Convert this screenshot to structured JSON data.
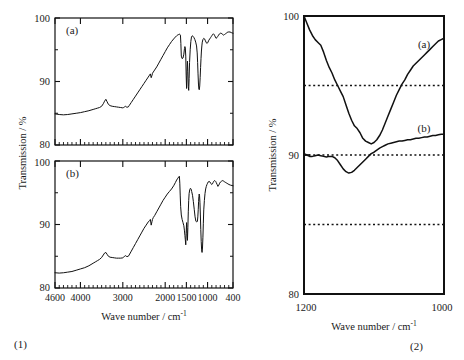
{
  "figure": {
    "panels": [
      {
        "number": "(1)",
        "xlabel": "Wave number / cm",
        "xlabel_sup": "-1",
        "ylabel": "Transmission / %",
        "subplots": [
          {
            "label": "(a)"
          },
          {
            "label": "(b)"
          }
        ]
      },
      {
        "number": "(2)",
        "xlabel": "Wave number / cm",
        "xlabel_sup": "-1",
        "ylabel": "Transmission / %",
        "curve_labels": [
          "(a)",
          "(b)"
        ]
      }
    ]
  },
  "chart_data": [
    {
      "type": "line",
      "id": "panel1-a",
      "title": "",
      "subplot_label": "(a)",
      "xlabel": "Wave number / cm-1",
      "ylabel": "Transmission / %",
      "xlim": [
        4600,
        400
      ],
      "ylim": [
        80,
        100
      ],
      "x_ticks": [
        4600,
        4000,
        3000,
        2000,
        1500,
        1000,
        400
      ],
      "x_tick_labels": [
        "4600",
        "4000",
        "3000",
        "2000",
        "1500",
        "1000",
        "400"
      ],
      "x_minor_ticks": [
        4500,
        4400,
        4300,
        4200,
        4100,
        3900,
        3800,
        3700,
        3600,
        3500,
        3400,
        3300,
        3200,
        3100,
        2900,
        2800,
        2700,
        2600,
        2500,
        2400,
        2300,
        2200,
        2100,
        1900,
        1800,
        1700,
        1600,
        1400,
        1300,
        1200,
        1100,
        900,
        800,
        700,
        600,
        500
      ],
      "y_ticks": [
        80,
        90,
        100
      ],
      "y_tick_labels": [
        "80",
        "90",
        "100"
      ],
      "grid": false,
      "axis_reversed_x": true,
      "x": [
        4600,
        4500,
        4400,
        4300,
        4200,
        4100,
        4000,
        3900,
        3800,
        3750,
        3700,
        3650,
        3600,
        3550,
        3500,
        3460,
        3430,
        3400,
        3370,
        3340,
        3300,
        3250,
        3200,
        3150,
        3100,
        3050,
        3000,
        2980,
        2960,
        2940,
        2920,
        2900,
        2870,
        2850,
        2800,
        2750,
        2700,
        2650,
        2600,
        2550,
        2500,
        2450,
        2400,
        2370,
        2350,
        2330,
        2310,
        2300,
        2280,
        2250,
        2200,
        2150,
        2100,
        2050,
        2000,
        1950,
        1900,
        1850,
        1800,
        1760,
        1730,
        1700,
        1680,
        1660,
        1650,
        1640,
        1630,
        1620,
        1600,
        1580,
        1560,
        1545,
        1535,
        1525,
        1515,
        1505,
        1495,
        1485,
        1475,
        1465,
        1455,
        1445,
        1435,
        1425,
        1410,
        1395,
        1380,
        1360,
        1340,
        1320,
        1300,
        1280,
        1260,
        1245,
        1235,
        1225,
        1215,
        1205,
        1195,
        1185,
        1175,
        1165,
        1155,
        1145,
        1135,
        1125,
        1110,
        1090,
        1070,
        1050,
        1030,
        1010,
        990,
        970,
        950,
        930,
        910,
        890,
        875,
        860,
        845,
        830,
        815,
        800,
        780,
        760,
        740,
        720,
        700,
        680,
        660,
        640,
        620,
        600,
        580,
        560,
        540,
        520,
        500,
        470,
        440,
        400
      ],
      "y": [
        84.9,
        84.8,
        84.75,
        84.8,
        84.9,
        85.0,
        85.1,
        85.25,
        85.4,
        85.5,
        85.6,
        85.7,
        85.8,
        85.9,
        86.1,
        86.5,
        86.9,
        87.2,
        86.8,
        86.4,
        86.2,
        86.1,
        86.05,
        86.0,
        85.95,
        85.9,
        85.85,
        85.9,
        86.0,
        86.1,
        86.0,
        85.95,
        86.0,
        86.2,
        86.7,
        87.2,
        87.7,
        88.2,
        88.7,
        89.2,
        89.7,
        90.2,
        90.7,
        91.0,
        91.2,
        90.6,
        91.0,
        91.3,
        91.5,
        91.8,
        92.3,
        92.9,
        93.5,
        94.1,
        94.7,
        95.3,
        95.8,
        96.3,
        96.7,
        97.0,
        97.2,
        97.35,
        97.4,
        97.45,
        97.4,
        97.3,
        96.0,
        94.0,
        93.6,
        93.7,
        94.3,
        95.2,
        95.5,
        95.3,
        94.0,
        91.0,
        88.9,
        91.5,
        93.2,
        91.6,
        89.2,
        88.6,
        90.5,
        93.0,
        95.0,
        96.3,
        97.0,
        97.2,
        97.1,
        96.9,
        96.6,
        96.2,
        95.6,
        94.5,
        93.0,
        91.2,
        89.6,
        88.8,
        88.7,
        89.3,
        90.6,
        92.2,
        93.6,
        94.8,
        95.6,
        96.2,
        96.6,
        96.8,
        96.7,
        96.4,
        96.1,
        96.0,
        96.2,
        96.5,
        96.7,
        96.9,
        97.1,
        97.3,
        97.45,
        97.5,
        97.4,
        97.2,
        97.0,
        96.8,
        96.9,
        97.1,
        97.3,
        97.5,
        97.6,
        97.6,
        97.5,
        97.4,
        97.3,
        97.4,
        97.5,
        97.6,
        97.7,
        97.8,
        97.8,
        97.8,
        97.7,
        97.6,
        97.5
      ]
    },
    {
      "type": "line",
      "id": "panel1-b",
      "title": "",
      "subplot_label": "(b)",
      "xlabel": "Wave number / cm-1",
      "ylabel": "Transmission / %",
      "xlim": [
        4600,
        400
      ],
      "ylim": [
        80,
        100
      ],
      "x_ticks": [
        4600,
        4000,
        3000,
        2000,
        1500,
        1000,
        400
      ],
      "x_tick_labels": [
        "4600",
        "4000",
        "3000",
        "2000",
        "1500",
        "1000",
        "400"
      ],
      "y_ticks": [
        80,
        90,
        100
      ],
      "y_tick_labels": [
        "80",
        "90",
        "100"
      ],
      "grid": false,
      "axis_reversed_x": true,
      "x": [
        4600,
        4500,
        4400,
        4300,
        4200,
        4100,
        4000,
        3900,
        3800,
        3750,
        3700,
        3650,
        3600,
        3550,
        3500,
        3460,
        3430,
        3400,
        3370,
        3340,
        3300,
        3250,
        3200,
        3150,
        3100,
        3050,
        3000,
        2980,
        2960,
        2940,
        2920,
        2900,
        2870,
        2850,
        2800,
        2750,
        2700,
        2650,
        2600,
        2550,
        2500,
        2450,
        2400,
        2370,
        2350,
        2330,
        2310,
        2300,
        2280,
        2250,
        2200,
        2150,
        2100,
        2050,
        2000,
        1950,
        1900,
        1850,
        1800,
        1760,
        1730,
        1700,
        1680,
        1665,
        1655,
        1645,
        1635,
        1620,
        1600,
        1580,
        1560,
        1545,
        1535,
        1525,
        1515,
        1505,
        1495,
        1485,
        1475,
        1465,
        1455,
        1445,
        1435,
        1420,
        1405,
        1390,
        1375,
        1355,
        1335,
        1315,
        1295,
        1275,
        1255,
        1240,
        1230,
        1220,
        1212,
        1205,
        1198,
        1190,
        1180,
        1170,
        1160,
        1150,
        1140,
        1130,
        1120,
        1110,
        1100,
        1090,
        1075,
        1060,
        1045,
        1030,
        1015,
        1000,
        985,
        965,
        945,
        925,
        905,
        885,
        870,
        855,
        840,
        825,
        810,
        795,
        775,
        755,
        735,
        715,
        695,
        675,
        655,
        635,
        615,
        595,
        570,
        545,
        520,
        495,
        460,
        400
      ],
      "y": [
        82.4,
        82.35,
        82.4,
        82.5,
        82.6,
        82.8,
        83.0,
        83.2,
        83.5,
        83.7,
        83.9,
        84.1,
        84.3,
        84.5,
        84.8,
        85.2,
        85.5,
        85.6,
        85.3,
        85.0,
        84.85,
        84.8,
        84.75,
        84.7,
        84.7,
        84.7,
        84.75,
        84.85,
        85.0,
        85.1,
        85.0,
        84.95,
        85.0,
        85.2,
        85.8,
        86.4,
        87.0,
        87.6,
        88.2,
        88.8,
        89.4,
        89.9,
        90.4,
        90.6,
        90.8,
        89.9,
        90.5,
        90.8,
        91.1,
        91.4,
        92.0,
        92.6,
        93.2,
        93.8,
        94.3,
        94.8,
        95.2,
        95.6,
        96.1,
        96.6,
        97.0,
        97.3,
        97.5,
        97.6,
        96.5,
        94.5,
        92.8,
        91.5,
        90.8,
        90.3,
        89.8,
        89.0,
        88.3,
        87.6,
        86.8,
        88.6,
        90.3,
        89.0,
        87.5,
        89.5,
        92.0,
        93.8,
        94.9,
        95.5,
        95.7,
        95.6,
        95.2,
        94.6,
        93.6,
        92.4,
        91.2,
        90.5,
        90.4,
        90.5,
        91.2,
        92.4,
        93.6,
        94.4,
        94.8,
        94.6,
        93.5,
        91.5,
        89.2,
        87.3,
        86.0,
        85.6,
        86.3,
        88.0,
        90.2,
        92.3,
        93.8,
        94.9,
        95.6,
        96.0,
        96.3,
        96.5,
        96.7,
        96.8,
        96.7,
        96.5,
        96.3,
        96.4,
        96.6,
        96.8,
        96.9,
        96.9,
        96.8,
        96.6,
        96.3,
        96.0,
        96.2,
        96.5,
        96.7,
        96.8,
        96.9,
        96.9,
        96.8,
        96.7,
        96.6,
        96.5,
        96.4,
        96.3,
        96.2,
        96.1
      ]
    },
    {
      "type": "line",
      "id": "panel2",
      "title": "",
      "xlabel": "Wave number / cm-1",
      "ylabel": "Transmission / %",
      "xlim": [
        1200,
        1000
      ],
      "ylim": [
        80,
        100
      ],
      "x_ticks": [
        1200,
        1000
      ],
      "x_tick_labels": [
        "1200",
        "1000"
      ],
      "y_ticks": [
        80,
        90,
        100
      ],
      "y_tick_labels": [
        "80",
        "90",
        "100"
      ],
      "grid": false,
      "axis_reversed_x": true,
      "dotted_reference_lines": [
        95,
        90,
        85
      ],
      "series": [
        {
          "name": "(a)",
          "x": [
            1200,
            1196,
            1192,
            1188,
            1184,
            1180,
            1176,
            1172,
            1168,
            1164,
            1160,
            1156,
            1152,
            1148,
            1144,
            1140,
            1136,
            1132,
            1128,
            1124,
            1120,
            1116,
            1112,
            1108,
            1104,
            1100,
            1096,
            1092,
            1088,
            1084,
            1080,
            1076,
            1072,
            1068,
            1064,
            1060,
            1056,
            1052,
            1048,
            1044,
            1040,
            1036,
            1032,
            1028,
            1024,
            1020,
            1016,
            1012,
            1008,
            1004,
            1000
          ],
          "y": [
            100.0,
            99.5,
            99.0,
            98.6,
            98.3,
            98.1,
            97.9,
            97.4,
            96.8,
            96.3,
            95.9,
            95.4,
            95.0,
            94.6,
            94.2,
            93.6,
            93.0,
            92.5,
            92.1,
            91.9,
            91.6,
            91.2,
            91.0,
            90.9,
            90.8,
            90.9,
            91.1,
            91.4,
            91.8,
            92.3,
            92.8,
            93.3,
            93.8,
            94.3,
            94.7,
            95.1,
            95.4,
            95.8,
            96.1,
            96.4,
            96.6,
            96.8,
            97.0,
            97.2,
            97.4,
            97.6,
            97.8,
            98.0,
            98.2,
            98.3,
            98.4
          ]
        },
        {
          "name": "(b)",
          "x": [
            1200,
            1196,
            1192,
            1188,
            1184,
            1180,
            1176,
            1172,
            1168,
            1164,
            1160,
            1156,
            1152,
            1148,
            1144,
            1140,
            1136,
            1132,
            1128,
            1124,
            1120,
            1116,
            1112,
            1108,
            1104,
            1100,
            1096,
            1092,
            1088,
            1084,
            1080,
            1076,
            1072,
            1068,
            1064,
            1060,
            1056,
            1052,
            1048,
            1044,
            1040,
            1036,
            1032,
            1028,
            1024,
            1020,
            1016,
            1012,
            1008,
            1004,
            1000
          ],
          "y": [
            90.1,
            90.0,
            89.9,
            89.9,
            89.95,
            90.0,
            89.95,
            89.9,
            89.85,
            89.9,
            89.9,
            89.8,
            89.6,
            89.3,
            89.0,
            88.8,
            88.7,
            88.75,
            88.9,
            89.1,
            89.3,
            89.5,
            89.7,
            89.9,
            90.1,
            90.2,
            90.35,
            90.5,
            90.6,
            90.7,
            90.8,
            90.85,
            90.9,
            90.95,
            91.0,
            91.0,
            91.05,
            91.1,
            91.1,
            91.15,
            91.2,
            91.2,
            91.25,
            91.3,
            91.3,
            91.35,
            91.4,
            91.4,
            91.45,
            91.5,
            91.5
          ]
        }
      ]
    }
  ]
}
